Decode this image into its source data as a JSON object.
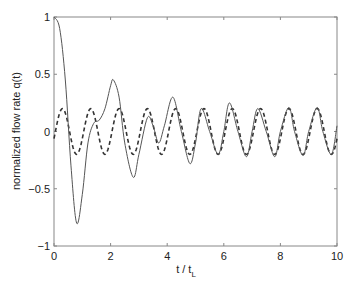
{
  "chart_data": {
    "type": "line",
    "title": "",
    "xlabel": "t / t_L",
    "ylabel": "normalized flow rate q(t)",
    "xlim": [
      0,
      10
    ],
    "ylim": [
      -1,
      1
    ],
    "xticks": [
      0,
      2,
      4,
      6,
      8,
      10
    ],
    "yticks": [
      1,
      0.5,
      0,
      -0.5,
      -1
    ],
    "ytick_labels": [
      "1",
      "0.5",
      "0",
      "−0.5",
      "−1"
    ],
    "grid": false,
    "legend": null,
    "series": [
      {
        "name": "transient response",
        "style": "solid",
        "color": "#555555",
        "points": [
          [
            0.0,
            1.0
          ],
          [
            0.2,
            0.9
          ],
          [
            0.4,
            0.45
          ],
          [
            0.6,
            -0.3
          ],
          [
            0.8,
            -0.8
          ],
          [
            1.0,
            -0.55
          ],
          [
            1.2,
            -0.1
          ],
          [
            1.4,
            0.07
          ],
          [
            1.6,
            0.1
          ],
          [
            1.8,
            0.2
          ],
          [
            2.0,
            0.4
          ],
          [
            2.1,
            0.45
          ],
          [
            2.3,
            0.3
          ],
          [
            2.5,
            -0.1
          ],
          [
            2.8,
            -0.4
          ],
          [
            3.0,
            -0.2
          ],
          [
            3.3,
            0.12
          ],
          [
            3.5,
            0.05
          ],
          [
            3.7,
            -0.1
          ],
          [
            3.9,
            0.05
          ],
          [
            4.2,
            0.3
          ],
          [
            4.5,
            0.0
          ],
          [
            4.8,
            -0.28
          ],
          [
            5.0,
            -0.1
          ],
          [
            5.2,
            0.2
          ],
          [
            5.5,
            0.0
          ],
          [
            5.8,
            -0.2
          ],
          [
            6.0,
            0.0
          ],
          [
            6.2,
            0.25
          ],
          [
            6.5,
            0.0
          ],
          [
            6.8,
            -0.22
          ],
          [
            7.0,
            0.0
          ],
          [
            7.2,
            0.2
          ],
          [
            7.5,
            0.0
          ],
          [
            7.8,
            -0.22
          ],
          [
            8.0,
            0.0
          ],
          [
            8.3,
            0.21
          ],
          [
            8.5,
            0.0
          ],
          [
            8.8,
            -0.21
          ],
          [
            9.0,
            0.0
          ],
          [
            9.3,
            0.21
          ],
          [
            9.5,
            0.0
          ],
          [
            9.8,
            -0.2
          ],
          [
            10.0,
            0.05
          ]
        ]
      },
      {
        "name": "steady-state oscillation",
        "style": "dashed",
        "color": "#333333",
        "amplitude": 0.2,
        "period": 1.0,
        "first_peak_t": 0.3
      }
    ]
  }
}
